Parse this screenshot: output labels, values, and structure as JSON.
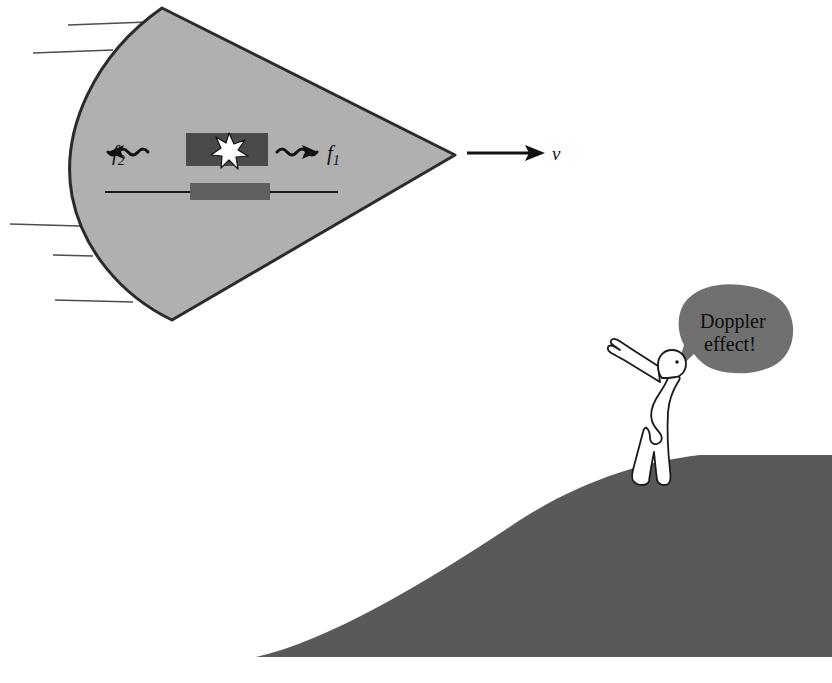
{
  "figure": {
    "background_color": "#ffffff"
  },
  "shock_cone": {
    "name": "mach-cone",
    "fill_color": "#b0b0b0",
    "stroke_color": "#2b2b2b"
  },
  "aircraft": {
    "fuselage_color": "#4a4a4a",
    "wing_color": "#606060",
    "axis_line_color": "#1a1a1a",
    "burst_color": "#ffffff",
    "burst_outline_color": "#111111"
  },
  "wave_labels": {
    "forward": {
      "symbol": "f",
      "subscript": "1",
      "direction": "right",
      "description": "forward-shifted higher frequency"
    },
    "backward": {
      "symbol": "f",
      "subscript": "2",
      "direction": "left",
      "description": "backward-shifted lower frequency"
    }
  },
  "velocity": {
    "label": "v",
    "direction": "right",
    "arrow_color": "#111111"
  },
  "wake_lines": {
    "color": "#4d4d4d",
    "count": 5
  },
  "speech_bubble": {
    "text_line_1": "Doppler",
    "text_line_2": "effect!",
    "fill_color": "#707070",
    "text_color": "#0d0d0d"
  },
  "observer": {
    "name": "person",
    "body_fill": "#ffffff",
    "outline_color": "#1a1a1a",
    "pose": "pointing-up-left"
  },
  "hill": {
    "fill_color": "#595959"
  }
}
